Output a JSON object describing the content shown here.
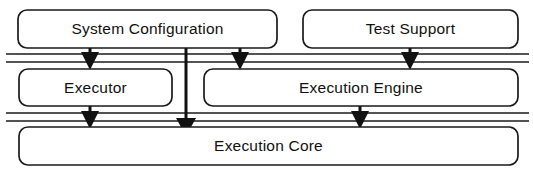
{
  "diagram": {
    "type": "layered-block-diagram",
    "colors": {
      "background": "#ffffff",
      "box_fill": "#ffffff",
      "box_stroke": "#1a1a1a",
      "layer_line": "#1a1a1a",
      "arrow": "#111111",
      "text": "#111111"
    },
    "nodes": [
      {
        "id": "system-configuration",
        "label": "System Configuration",
        "row": 0,
        "x": 18,
        "y": 10,
        "width": 259,
        "height": 38
      },
      {
        "id": "test-support",
        "label": "Test Support",
        "row": 0,
        "x": 303,
        "y": 10,
        "width": 215,
        "height": 38
      },
      {
        "id": "executor",
        "label": "Executor",
        "row": 1,
        "x": 19,
        "y": 69,
        "width": 153,
        "height": 37
      },
      {
        "id": "execution-engine",
        "label": "Execution Engine",
        "row": 1,
        "x": 204,
        "y": 69,
        "width": 314,
        "height": 37
      },
      {
        "id": "execution-core",
        "label": "Execution Core",
        "row": 2,
        "x": 19,
        "y": 127,
        "width": 499,
        "height": 38
      }
    ],
    "layer_separators": [
      {
        "id": "separator-upper-a",
        "y": 54,
        "x1": 6,
        "x2": 529
      },
      {
        "id": "separator-upper-b",
        "y": 62,
        "x1": 6,
        "x2": 529
      },
      {
        "id": "separator-lower-a",
        "y": 113,
        "x1": 6,
        "x2": 529
      },
      {
        "id": "separator-lower-b",
        "y": 121,
        "x1": 6,
        "x2": 529
      }
    ],
    "connectors": [
      {
        "id": "system-configuration-to-executor",
        "from": "system-configuration",
        "to": "executor",
        "x": 90,
        "y1": 48,
        "y2": 69
      },
      {
        "id": "system-configuration-to-execution-engine",
        "from": "system-configuration",
        "to": "execution-engine",
        "x": 240,
        "y1": 48,
        "y2": 69
      },
      {
        "id": "test-support-to-execution-engine",
        "from": "test-support",
        "to": "execution-engine",
        "x": 410,
        "y1": 48,
        "y2": 69
      },
      {
        "id": "system-configuration-to-execution-core",
        "from": "system-configuration",
        "to": "execution-core",
        "x": 186,
        "y1": 48,
        "y2": 127
      },
      {
        "id": "executor-to-execution-core",
        "from": "executor",
        "to": "execution-core",
        "x": 90,
        "y1": 106,
        "y2": 127
      },
      {
        "id": "execution-engine-to-execution-core",
        "from": "execution-engine",
        "to": "execution-core",
        "x": 360,
        "y1": 106,
        "y2": 127
      }
    ]
  }
}
